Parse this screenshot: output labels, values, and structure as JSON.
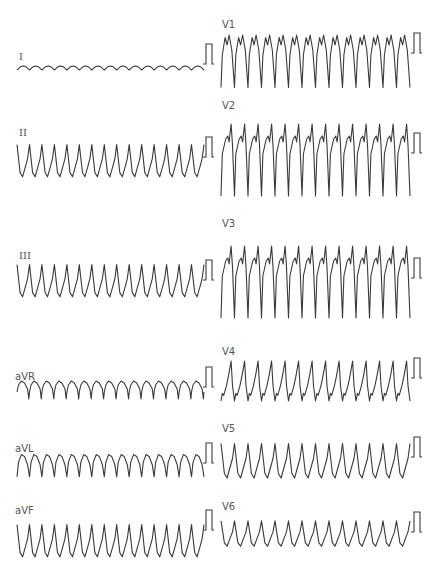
{
  "figure": {
    "type": "12-lead ECG",
    "layout": "two columns x six rows",
    "trace_color": "#3a3a3a",
    "label_color": "#555555",
    "background": "#ffffff"
  },
  "leads": [
    {
      "id": "I",
      "label": "I",
      "column": 0,
      "label_x": 19,
      "label_y": 52,
      "baseline": 70,
      "beats": 15,
      "morph": "scallop-low",
      "amp": 4,
      "cal_x": 206,
      "cal_top": 44
    },
    {
      "id": "II",
      "label": "II",
      "column": 0,
      "label_x": 19,
      "label_y": 128,
      "baseline": 160,
      "beats": 15,
      "morph": "peak-up",
      "amp": 28,
      "cal_x": 206,
      "cal_top": 137
    },
    {
      "id": "III",
      "label": "III",
      "column": 0,
      "label_x": 19,
      "label_y": 251,
      "baseline": 280,
      "beats": 15,
      "morph": "peak-up",
      "amp": 28,
      "cal_x": 206,
      "cal_top": 260
    },
    {
      "id": "aVR",
      "label": "aVR",
      "column": 0,
      "label_x": 15,
      "label_y": 372,
      "baseline": 390,
      "beats": 15,
      "morph": "scallop-down",
      "amp": 10,
      "cal_x": 206,
      "cal_top": 367
    },
    {
      "id": "aVL",
      "label": "aVL",
      "column": 0,
      "label_x": 15,
      "label_y": 444,
      "baseline": 466,
      "beats": 15,
      "morph": "arch-up",
      "amp": 12,
      "cal_x": 206,
      "cal_top": 443
    },
    {
      "id": "aVF",
      "label": "aVF",
      "column": 0,
      "label_x": 15,
      "label_y": 506,
      "baseline": 540,
      "beats": 15,
      "morph": "peak-up",
      "amp": 28,
      "cal_x": 206,
      "cal_top": 510
    },
    {
      "id": "V1",
      "label": "V1",
      "column": 1,
      "label_x": 222,
      "label_y": 20,
      "baseline": 60,
      "beats": 14,
      "morph": "m-deep",
      "amp": 50,
      "cal_x": 414,
      "cal_top": 33
    },
    {
      "id": "V2",
      "label": "V2",
      "column": 1,
      "label_x": 222,
      "label_y": 101,
      "baseline": 157,
      "beats": 14,
      "morph": "v2-tall",
      "amp": 60,
      "cal_x": 414,
      "cal_top": 133
    },
    {
      "id": "V3",
      "label": "V3",
      "column": 1,
      "label_x": 222,
      "label_y": 219,
      "baseline": 279,
      "beats": 14,
      "morph": "v2-tall",
      "amp": 60,
      "cal_x": 414,
      "cal_top": 258
    },
    {
      "id": "V4",
      "label": "V4",
      "column": 1,
      "label_x": 222,
      "label_y": 347,
      "baseline": 382,
      "beats": 14,
      "morph": "v4",
      "amp": 38,
      "cal_x": 414,
      "cal_top": 358
    },
    {
      "id": "V5",
      "label": "V5",
      "column": 1,
      "label_x": 222,
      "label_y": 424,
      "baseline": 460,
      "beats": 14,
      "morph": "peak-up",
      "amp": 30,
      "cal_x": 414,
      "cal_top": 437
    },
    {
      "id": "V6",
      "label": "V6",
      "column": 1,
      "label_x": 222,
      "label_y": 502,
      "baseline": 533,
      "beats": 14,
      "morph": "peak-up-small",
      "amp": 22,
      "cal_x": 414,
      "cal_top": 512
    }
  ],
  "columns": [
    {
      "x_start": 17,
      "x_end": 204
    },
    {
      "x_start": 221,
      "x_end": 410
    }
  ],
  "calibration": {
    "width": 6,
    "height": 20
  }
}
